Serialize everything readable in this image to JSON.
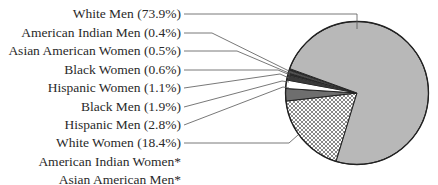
{
  "chart_data": {
    "type": "pie",
    "title": "",
    "slices": [
      {
        "label": "White Men (73.9%)",
        "name": "White Men",
        "value": 73.9,
        "fill": "#b8b8b8"
      },
      {
        "label": "American Indian Men (0.4%)",
        "name": "American Indian Men",
        "value": 0.4,
        "fill": "#2b2b2b"
      },
      {
        "label": "Asian American Women (0.5%)",
        "name": "Asian American Women",
        "value": 0.5,
        "fill": "#555555"
      },
      {
        "label": "Black Women (0.6%)",
        "name": "Black Women",
        "value": 0.6,
        "fill": "#2b2b2b"
      },
      {
        "label": "Hispanic Women (1.1%)",
        "name": "Hispanic Women",
        "value": 1.1,
        "fill": "#3a3a3a"
      },
      {
        "label": "Black Men (1.9%)",
        "name": "Black Men",
        "value": 1.9,
        "fill": "#ffffff"
      },
      {
        "label": "Hispanic Men (2.8%)",
        "name": "Hispanic Men",
        "value": 2.8,
        "fill": "#6e6e6e"
      },
      {
        "label": "White Women (18.4%)",
        "name": "White Women",
        "value": 18.4,
        "fill": "crosshatch"
      }
    ],
    "footnote_labels": [
      "American Indian Women*",
      "Asian American Men*"
    ],
    "legend_position": "left, with leader lines"
  }
}
